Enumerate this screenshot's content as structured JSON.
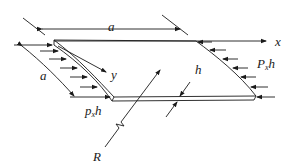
{
  "diagram": {
    "labels": {
      "a_top": "a",
      "a_left": "a",
      "x_axis": "x",
      "y_axis": "y",
      "thickness": "h",
      "radius": "R",
      "load_left_main": "p",
      "load_left_sub": "x",
      "load_left_tail": "h",
      "load_right_main": "P",
      "load_right_sub": "x",
      "load_right_tail": "h"
    },
    "colors": {
      "stroke": "#1a1a1a",
      "background": "#ffffff"
    }
  }
}
